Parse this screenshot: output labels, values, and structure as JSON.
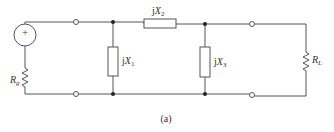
{
  "diagram": {
    "type": "circuit",
    "caption": "(a)",
    "components": {
      "source": {
        "symbol": "+",
        "kind": "voltage-source"
      },
      "source_resistor": {
        "label_main": "R",
        "label_sub": "g"
      },
      "shunt_1": {
        "label_j": "j",
        "label_main": "X",
        "label_sub": "1"
      },
      "series_2": {
        "label_j": "j",
        "label_main": "X",
        "label_sub": "2"
      },
      "shunt_3": {
        "label_j": "j",
        "label_main": "X",
        "label_sub": "3"
      },
      "load_resistor": {
        "label_main": "R",
        "label_sub": "L"
      }
    },
    "colors": {
      "line": "#555555",
      "background": "#ffffff"
    }
  }
}
